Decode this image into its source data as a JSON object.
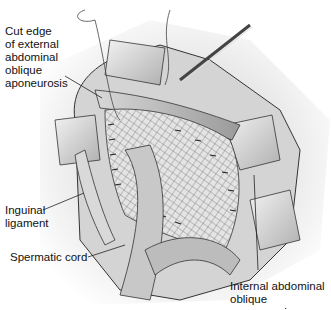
{
  "figure": {
    "labels": {
      "cut_edge": "Cut edge\nof external\nabdominal\noblique\naponeurosis",
      "inguinal_ligament": "Inguinal\nligament",
      "spermatic_cord": "Spermatic cord",
      "internal_oblique": "Internal abdominal\noblique aponeurosis"
    },
    "colors": {
      "background": "#ffffff",
      "line": "#333333",
      "tissue_light": "#e6e6e6",
      "tissue_mid": "#bdbdbd",
      "tissue_dark": "#8c8c8c"
    }
  }
}
